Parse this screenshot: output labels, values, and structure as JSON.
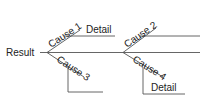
{
  "diagram": {
    "type": "fishbone",
    "result": "Result",
    "causes": [
      {
        "label": "Cause 1",
        "detail": "Detail"
      },
      {
        "label": "Cause 2"
      },
      {
        "label": "Cause 3"
      },
      {
        "label": "Cause 4",
        "detail": "Detail"
      }
    ],
    "colors": {
      "line": "#555555",
      "text": "#222222",
      "background": "#ffffff"
    }
  }
}
